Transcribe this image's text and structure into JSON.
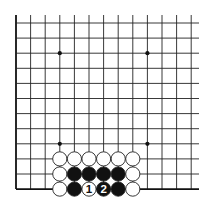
{
  "board": {
    "cols": 13,
    "rows": 12,
    "origin_x": 16,
    "origin_y": 23,
    "spacing_x": 14.6,
    "spacing_y": 15.1,
    "line_extend_right": 199,
    "line_extend_top": 15,
    "edges": [
      "left",
      "bottom"
    ],
    "line_color": "#222222",
    "edge_color": "#111111",
    "star_points": [
      [
        3,
        2
      ],
      [
        9,
        2
      ],
      [
        3,
        8
      ],
      [
        9,
        8
      ]
    ]
  },
  "stones": [
    {
      "col": 3,
      "row": 9,
      "color": "white"
    },
    {
      "col": 4,
      "row": 9,
      "color": "white"
    },
    {
      "col": 5,
      "row": 9,
      "color": "white"
    },
    {
      "col": 6,
      "row": 9,
      "color": "white"
    },
    {
      "col": 7,
      "row": 9,
      "color": "white"
    },
    {
      "col": 8,
      "row": 9,
      "color": "white"
    },
    {
      "col": 3,
      "row": 10,
      "color": "white"
    },
    {
      "col": 4,
      "row": 10,
      "color": "black"
    },
    {
      "col": 5,
      "row": 10,
      "color": "black"
    },
    {
      "col": 6,
      "row": 10,
      "color": "black"
    },
    {
      "col": 7,
      "row": 10,
      "color": "black"
    },
    {
      "col": 8,
      "row": 10,
      "color": "white"
    },
    {
      "col": 3,
      "row": 11,
      "color": "white"
    },
    {
      "col": 4,
      "row": 11,
      "color": "black"
    },
    {
      "col": 5,
      "row": 11,
      "color": "white",
      "label": "1"
    },
    {
      "col": 6,
      "row": 11,
      "color": "black",
      "label": "2"
    },
    {
      "col": 7,
      "row": 11,
      "color": "black"
    },
    {
      "col": 8,
      "row": 11,
      "color": "white"
    }
  ]
}
